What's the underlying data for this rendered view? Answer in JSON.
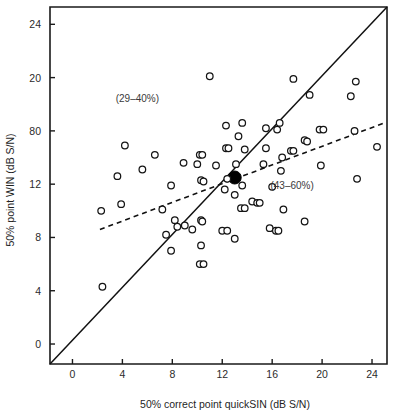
{
  "chart_data": {
    "type": "scatter",
    "title": "",
    "xlabel": "50% correct point quickSIN (dB S/N)",
    "ylabel": "50% point WIN (dB S/N)",
    "xlim": [
      -1.8,
      25.2
    ],
    "ylim": [
      -1.5,
      25.3
    ],
    "xticks": [
      0,
      4,
      8,
      12,
      16,
      20,
      24
    ],
    "xticklabels": [
      "0",
      "4",
      "8",
      "12",
      "16",
      "20",
      "24"
    ],
    "yticks": [
      0,
      4,
      8,
      12,
      16,
      20,
      24
    ],
    "yticklabels": [
      "0",
      "4",
      "8",
      "80",
      "12",
      "20",
      "24"
    ],
    "yticklabels_ordered": [
      "24",
      "20",
      "80",
      "12",
      "8",
      "4",
      "0"
    ],
    "grid": false,
    "legend": false,
    "annotations": [
      {
        "text": "(29–40%)",
        "x": 5.2,
        "y": 18.2
      },
      {
        "text": "(43–60%)",
        "x": 17.6,
        "y": 11.6
      }
    ],
    "lines": [
      {
        "name": "identity-line",
        "style": "solid",
        "points": [
          [
            -1.8,
            -1.5
          ],
          [
            25.2,
            25.3
          ]
        ]
      },
      {
        "name": "regression-line",
        "style": "dashed",
        "points": [
          [
            2.2,
            8.6
          ],
          [
            25.0,
            16.6
          ]
        ]
      }
    ],
    "series": [
      {
        "name": "mean-point",
        "marker": "filled-circle",
        "points": [
          [
            13.0,
            12.5
          ]
        ]
      },
      {
        "name": "participants",
        "marker": "open-circle",
        "points": [
          [
            11.0,
            20.1
          ],
          [
            17.7,
            19.9
          ],
          [
            22.7,
            19.7
          ],
          [
            19.0,
            18.7
          ],
          [
            22.3,
            18.6
          ],
          [
            13.6,
            16.6
          ],
          [
            16.6,
            16.6
          ],
          [
            12.3,
            16.4
          ],
          [
            15.5,
            16.2
          ],
          [
            16.4,
            16.1
          ],
          [
            19.8,
            16.1
          ],
          [
            20.1,
            16.1
          ],
          [
            22.6,
            16.0
          ],
          [
            13.3,
            15.6
          ],
          [
            18.6,
            15.3
          ],
          [
            18.8,
            15.2
          ],
          [
            4.2,
            14.9
          ],
          [
            12.3,
            14.7
          ],
          [
            12.5,
            14.7
          ],
          [
            13.8,
            14.6
          ],
          [
            15.5,
            14.7
          ],
          [
            17.5,
            14.5
          ],
          [
            17.7,
            14.5
          ],
          [
            24.4,
            14.8
          ],
          [
            6.6,
            14.2
          ],
          [
            10.2,
            14.2
          ],
          [
            10.4,
            14.2
          ],
          [
            16.8,
            14.0
          ],
          [
            8.9,
            13.6
          ],
          [
            10.0,
            13.5
          ],
          [
            11.5,
            13.4
          ],
          [
            13.1,
            13.5
          ],
          [
            15.3,
            13.5
          ],
          [
            19.9,
            13.4
          ],
          [
            5.6,
            13.1
          ],
          [
            16.7,
            13.0
          ],
          [
            3.6,
            12.6
          ],
          [
            10.3,
            12.3
          ],
          [
            10.5,
            12.2
          ],
          [
            12.4,
            12.4
          ],
          [
            22.8,
            12.4
          ],
          [
            7.9,
            11.9
          ],
          [
            12.2,
            11.6
          ],
          [
            13.6,
            11.9
          ],
          [
            13.0,
            11.2
          ],
          [
            16.0,
            11.8
          ],
          [
            3.9,
            10.5
          ],
          [
            14.4,
            10.7
          ],
          [
            14.8,
            10.6
          ],
          [
            15.0,
            10.6
          ],
          [
            13.5,
            10.2
          ],
          [
            13.8,
            10.2
          ],
          [
            7.2,
            10.1
          ],
          [
            16.9,
            10.1
          ],
          [
            2.3,
            10.0
          ],
          [
            8.2,
            9.3
          ],
          [
            9.0,
            8.9
          ],
          [
            10.3,
            9.3
          ],
          [
            10.4,
            9.2
          ],
          [
            18.6,
            9.2
          ],
          [
            8.4,
            8.8
          ],
          [
            9.6,
            8.6
          ],
          [
            15.8,
            8.7
          ],
          [
            16.3,
            8.5
          ],
          [
            16.5,
            8.5
          ],
          [
            12.0,
            8.5
          ],
          [
            12.4,
            8.5
          ],
          [
            7.5,
            8.2
          ],
          [
            13.0,
            7.9
          ],
          [
            10.3,
            7.4
          ],
          [
            7.9,
            7.0
          ],
          [
            10.2,
            6.0
          ],
          [
            10.5,
            6.0
          ],
          [
            2.4,
            4.3
          ]
        ]
      }
    ]
  },
  "figure": {
    "plot_area_note": "scatter-plot-canvas"
  }
}
